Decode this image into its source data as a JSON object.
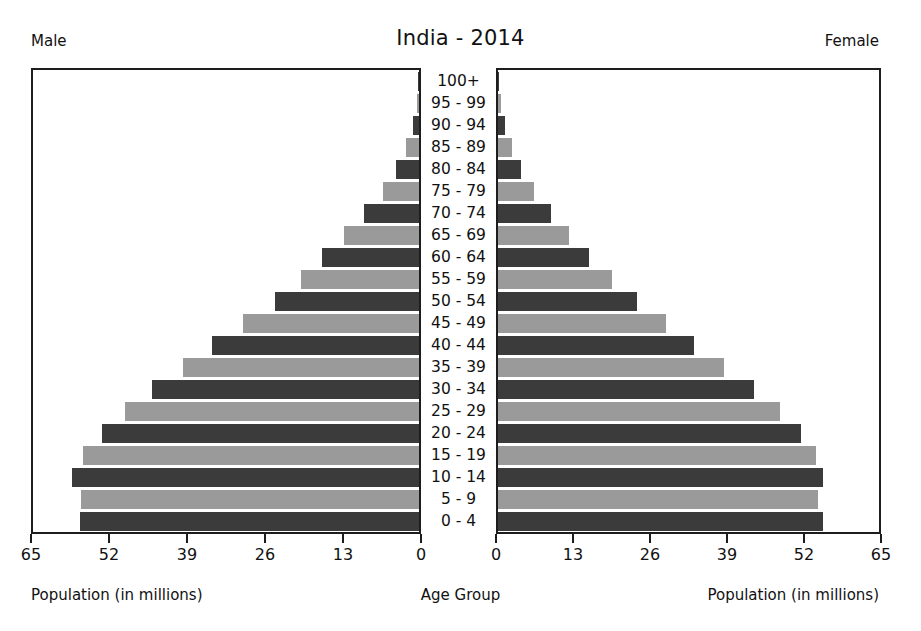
{
  "header": {
    "title": "India - 2014",
    "male_label": "Male",
    "female_label": "Female"
  },
  "captions": {
    "left_axis": "Population (in millions)",
    "center_axis": "Age Group",
    "right_axis": "Population (in millions)"
  },
  "axes": {
    "left_ticks": [
      "65",
      "52",
      "39",
      "26",
      "13",
      "0"
    ],
    "right_ticks": [
      "0",
      "13",
      "26",
      "39",
      "52",
      "65"
    ],
    "max": 65,
    "tick_step": 13
  },
  "chart_data": {
    "type": "bar",
    "subtype": "population-pyramid",
    "title": "India - 2014",
    "xlabel": "Population (in millions)",
    "ylabel": "Age Group",
    "xlim": [
      0,
      65
    ],
    "grid": false,
    "legend": "none",
    "orientation": "horizontal-diverging",
    "categories": [
      "100+",
      "95 - 99",
      "90 - 94",
      "85 - 89",
      "80 - 84",
      "75 - 79",
      "70 - 74",
      "65 - 69",
      "60 - 64",
      "55 - 59",
      "50 - 54",
      "45 - 49",
      "40 - 44",
      "35 - 39",
      "30 - 34",
      "25 - 29",
      "20 - 24",
      "15 - 19",
      "10 - 14",
      "5 - 9",
      "0 - 4"
    ],
    "series": [
      {
        "name": "Male",
        "side": "left",
        "color": "#3b3b3b",
        "values": [
          0.1,
          0.4,
          1.0,
          2.2,
          3.8,
          6.0,
          9.3,
          12.6,
          16.4,
          19.9,
          24.3,
          29.6,
          34.8,
          39.8,
          44.9,
          49.5,
          53.3,
          56.6,
          58.4,
          56.9,
          57.1
        ]
      },
      {
        "name": "Female",
        "side": "right",
        "color": "#9a9a9a",
        "values": [
          0.1,
          0.5,
          1.2,
          2.4,
          4.0,
          6.2,
          9.1,
          12.1,
          15.6,
          19.4,
          23.7,
          28.6,
          33.5,
          38.6,
          43.7,
          48.1,
          51.7,
          54.3,
          55.4,
          54.6,
          55.4
        ]
      }
    ],
    "bar_shading_pattern": "alternating dark/light by age band"
  }
}
